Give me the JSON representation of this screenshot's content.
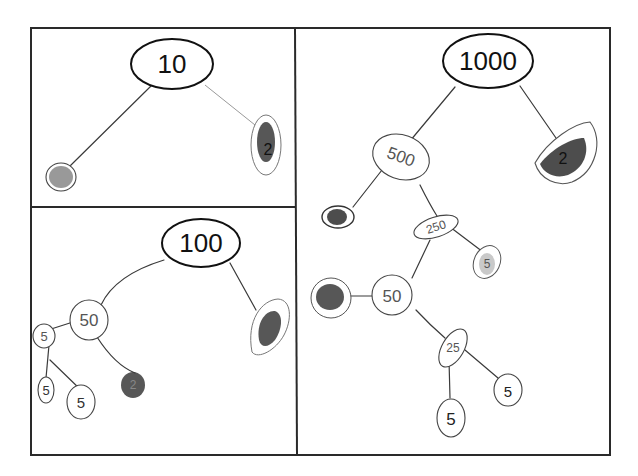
{
  "figure": {
    "panels": [
      {
        "id": "panel-10",
        "root": "10",
        "children": [
          {
            "label": "",
            "style": "shaded-circle"
          },
          {
            "label": "2",
            "style": "shaded-oval"
          }
        ]
      },
      {
        "id": "panel-100",
        "root": "100",
        "children": [
          {
            "label": "50",
            "children": [
              {
                "label": "5",
                "children": [
                  {
                    "label": "5"
                  },
                  {
                    "label": "5"
                  }
                ]
              },
              {
                "label": "2",
                "style": "shaded"
              }
            ]
          },
          {
            "label": "",
            "style": "shaded-oval"
          }
        ]
      },
      {
        "id": "panel-1000",
        "root": "1000",
        "children": [
          {
            "label": "500",
            "children": [
              {
                "label": "2",
                "style": "shaded"
              },
              {
                "label": "250",
                "children": [
                  {
                    "label": "50",
                    "children": [
                      {
                        "label": "",
                        "style": "shaded"
                      },
                      {
                        "label": "25",
                        "children": [
                          {
                            "label": "5"
                          },
                          {
                            "label": "5"
                          }
                        ]
                      }
                    ]
                  },
                  {
                    "label": "5",
                    "style": "light-shaded"
                  }
                ]
              }
            ]
          },
          {
            "label": "2",
            "style": "shaded-half-oval"
          }
        ]
      }
    ]
  },
  "labels": {
    "p10_root": "10",
    "p10_right": "2",
    "p100_root": "100",
    "p100_50": "50",
    "p100_5a": "5",
    "p100_5b": "5",
    "p100_5c": "5",
    "p100_2": "2",
    "p1000_root": "1000",
    "p1000_500": "500",
    "p1000_2left": "2",
    "p1000_250": "250",
    "p1000_5right": "5",
    "p1000_50": "50",
    "p1000_25": "25",
    "p1000_5a": "5",
    "p1000_5b": "5",
    "p1000_2right": "2"
  }
}
